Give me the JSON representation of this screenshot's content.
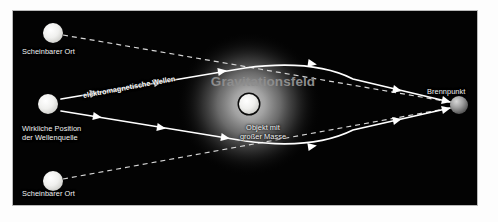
{
  "figure": {
    "background_color": "#030303",
    "border_color": "#b9b9b9",
    "ray_color": "#ffffff",
    "field_color": "#8d8d8d",
    "label_color": "#f2f2f2"
  },
  "labels": {
    "apparent_position_top": "Scheinbarer Ort",
    "apparent_position_bottom": "Scheinbarer Ort",
    "real_source_line1": "Wirkliche Position",
    "real_source_line2": "der Wellenquelle",
    "electromagnetic_waves": "elektromagnetische Wellen",
    "gravitational_field": "Gravitationsfeld",
    "massive_object_line1": "Objekt mit",
    "massive_object_line2": "großer Masse",
    "focal_point": "Brennpunkt"
  },
  "objects": {
    "apparent_top": {
      "name": "scheinbarer-ort-oben",
      "cx": 40,
      "cy": 22,
      "r": 10
    },
    "apparent_bottom": {
      "name": "scheinbarer-ort-unten",
      "cx": 40,
      "cy": 170,
      "r": 10
    },
    "real_source": {
      "name": "wellenquelle",
      "cx": 35,
      "cy": 93,
      "r": 10
    },
    "massive_object": {
      "name": "objekt-grosser-masse",
      "cx": 236,
      "cy": 93,
      "r": 11
    },
    "gravitational_field": {
      "name": "gravitationsfeld",
      "cx": 236,
      "cy": 93,
      "r": 72
    },
    "focal_point": {
      "name": "brennpunkt",
      "cx": 446,
      "cy": 94,
      "r": 9
    }
  },
  "rays": {
    "upper_path": "M 48,88 L 232,57 Q 300,48 340,68 L 437,91",
    "lower_path": "M 48,100 L 232,130 Q 300,139 340,119 L 437,97",
    "upper_dashed": "M 50,24 L 437,91",
    "lower_dashed": "M 50,168 L 437,97",
    "arrow_count_upper": 5,
    "arrow_count_lower": 5,
    "dash_pattern": "5 4"
  }
}
